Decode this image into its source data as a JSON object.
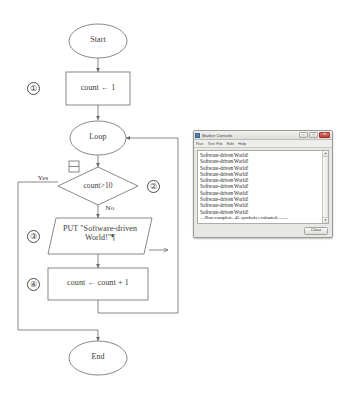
{
  "flowchart": {
    "nodes": {
      "start": "Start",
      "init": "count ← 1",
      "loop": "Loop",
      "decision": "count>10",
      "output": "PUT \"Software-driven\nWorld!\"¶",
      "increment": "count ← count + 1",
      "end": "End"
    },
    "edges": {
      "yes": "Yes",
      "no": "No"
    },
    "markers": {
      "one": "①",
      "two": "②",
      "three": "③",
      "four": "④"
    }
  },
  "console": {
    "title": "Marker Console",
    "menu": [
      "Run",
      "Test File",
      "Edit",
      "Help"
    ],
    "buttons": {
      "minimize": "–",
      "maximize": "□",
      "close": "✕"
    },
    "scrollbar": {
      "up": "▲",
      "down": "▼"
    },
    "output_lines": [
      "Software-driven World!",
      "Software-driven World!",
      "Software-driven World!",
      "Software-driven World!",
      "Software-driven World!",
      "Software-driven World!",
      "Software-driven World!",
      "Software-driven World!",
      "Software-driven World!",
      "Software-driven World!"
    ],
    "summary_line": "—Run complete.  45 symbols evaluated.——",
    "clear_label": "Clear"
  }
}
